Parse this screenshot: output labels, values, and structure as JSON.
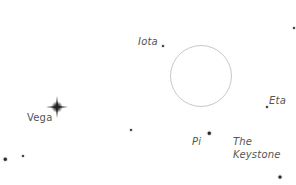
{
  "map": {
    "background": "#ffffff",
    "star_color": "#2a2a2a",
    "label_color": "#555555",
    "circle_color": "#c8c8c8",
    "highlight_circle": {
      "cx": 201,
      "cy": 76,
      "r": 31
    },
    "bright_star": {
      "name": "Vega",
      "x": 57,
      "y": 107,
      "size": 20
    },
    "stars": [
      {
        "name": "iota-star",
        "x": 163,
        "y": 46,
        "size": 2
      },
      {
        "name": "eta-star",
        "x": 267,
        "y": 107,
        "size": 2
      },
      {
        "name": "pi-star",
        "x": 209,
        "y": 133,
        "size": 2.5
      },
      {
        "name": "faint-star-center",
        "x": 131,
        "y": 130,
        "size": 2
      },
      {
        "name": "bottom-left-star-1",
        "x": 5,
        "y": 159,
        "size": 2.5
      },
      {
        "name": "bottom-left-star-2",
        "x": 23,
        "y": 156,
        "size": 2
      },
      {
        "name": "bottom-right-star",
        "x": 280,
        "y": 177,
        "size": 3
      },
      {
        "name": "top-right-star",
        "x": 294,
        "y": 28,
        "size": 2
      }
    ],
    "labels": {
      "iota": "Iota",
      "vega": "Vega",
      "eta": "Eta",
      "pi": "Pi",
      "keystone_line1": "The",
      "keystone_line2": "Keystone"
    }
  }
}
